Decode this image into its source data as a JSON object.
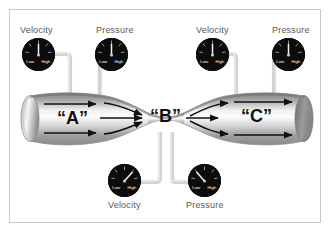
{
  "figure": {
    "background_color": "#ffffff",
    "frame_color": "#c8c8c8"
  },
  "pipe": {
    "sections": [
      {
        "id": "A",
        "label": "“A”",
        "role": "inlet"
      },
      {
        "id": "B",
        "label": "“B”",
        "role": "throat"
      },
      {
        "id": "C",
        "label": "“C”",
        "role": "outlet"
      }
    ],
    "highlight_color": "#fdfdfd",
    "shade_color": "#6f6f6f",
    "outline_color": "#9a9a9a",
    "arrow_color": "#111111"
  },
  "gauges": [
    {
      "id": "top-left-velocity",
      "label": "Velocity",
      "scale_low": "Low",
      "scale_high": "High",
      "needle_value": "mid",
      "needle_angle_deg": 0,
      "measures_section": "A",
      "position": "top-left"
    },
    {
      "id": "top-left-pressure",
      "label": "Pressure",
      "scale_low": "Low",
      "scale_high": "High",
      "needle_value": "mid",
      "needle_angle_deg": 0,
      "measures_section": "A",
      "position": "top-center-left"
    },
    {
      "id": "top-right-velocity",
      "label": "Velocity",
      "scale_low": "Low",
      "scale_high": "High",
      "needle_value": "mid",
      "needle_angle_deg": 0,
      "measures_section": "C",
      "position": "top-center-right"
    },
    {
      "id": "top-right-pressure",
      "label": "Pressure",
      "scale_low": "Low",
      "scale_high": "High",
      "needle_value": "mid",
      "needle_angle_deg": 0,
      "measures_section": "C",
      "position": "top-right"
    },
    {
      "id": "bottom-velocity",
      "label": "Velocity",
      "scale_low": "Low",
      "scale_high": "High",
      "needle_value": "high",
      "needle_angle_deg": 42,
      "measures_section": "B",
      "position": "bottom-left"
    },
    {
      "id": "bottom-pressure",
      "label": "Pressure",
      "scale_low": "Low",
      "scale_high": "High",
      "needle_value": "low",
      "needle_angle_deg": -42,
      "measures_section": "B",
      "position": "bottom-right"
    }
  ],
  "gauge_face": {
    "tick_color": "#e8e8e8",
    "needle_color": "#f2f2f2",
    "scale_text_color": "#ffffff",
    "face_color": "#101010"
  },
  "tubing": {
    "color": "#d2d2d2",
    "edge_color": "#9d9d9d"
  }
}
